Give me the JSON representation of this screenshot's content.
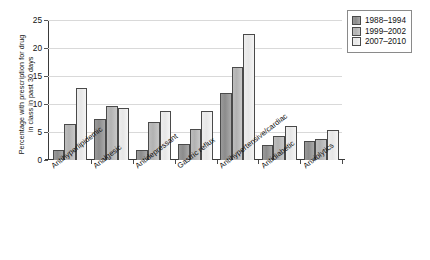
{
  "chart_data": {
    "type": "bar",
    "title": "",
    "xlabel": "",
    "ylabel": "Percentage with prescription for drug in class in past 30 days",
    "ylabel_line1": "Percentage with prescription for drug",
    "ylabel_line2": "in class in past 30 days",
    "ylim": [
      0,
      25
    ],
    "yticks": [
      0,
      5,
      10,
      15,
      20,
      25
    ],
    "ytick_labels": [
      "0",
      "5",
      "10",
      "15",
      "20",
      "25"
    ],
    "grid": true,
    "legend_position": "top-right",
    "categories": [
      "Antihyperlipidemic",
      "Analgesic",
      "Antidepressant",
      "Gastric reflux",
      "Antihypertensive/cardiac",
      "Antidiabetic",
      "Anxiolytics"
    ],
    "series": [
      {
        "name": "1988–1994",
        "color": "#999999",
        "values": [
          1.7,
          7.4,
          1.8,
          2.8,
          11.9,
          2.7,
          3.4
        ]
      },
      {
        "name": "1999–2002",
        "color": "#bdbdbd",
        "values": [
          6.5,
          9.6,
          6.8,
          5.6,
          16.6,
          4.2,
          3.8
        ]
      },
      {
        "name": "2007–2010",
        "color": "#efefef",
        "values": [
          12.8,
          9.2,
          8.8,
          8.8,
          22.5,
          6.0,
          5.3
        ]
      }
    ]
  },
  "legend": {
    "items": [
      {
        "label": "1988–1994",
        "swatch": "#999999"
      },
      {
        "label": "1999–2002",
        "swatch": "#bdbdbd"
      },
      {
        "label": "2007–2010",
        "swatch": "#f4f4f4"
      }
    ]
  },
  "caption": ""
}
